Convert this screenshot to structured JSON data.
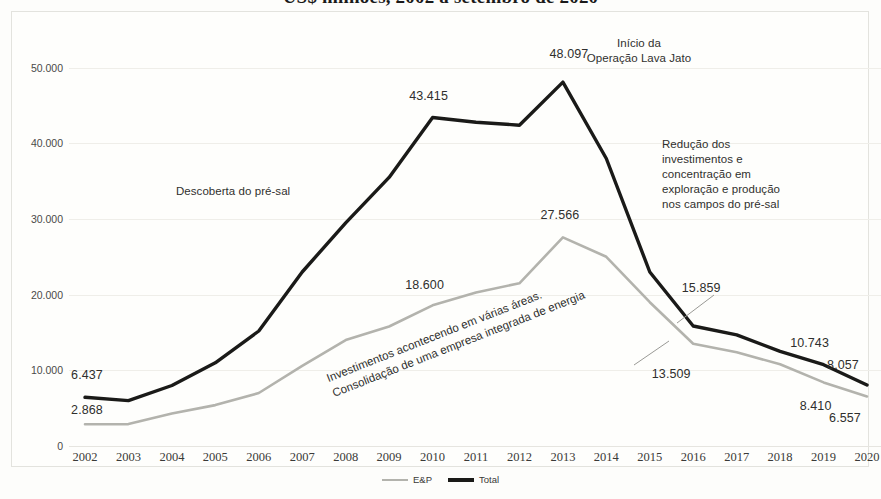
{
  "title": "US$ milhões, 2002 a setembro de 2020",
  "axis": {
    "y_ticks": [
      "50.000",
      "40.000",
      "30.000",
      "20.000",
      "10.000",
      "0"
    ],
    "y_values": [
      50000,
      40000,
      30000,
      20000,
      10000,
      0
    ],
    "x_ticks": [
      "2002",
      "2003",
      "2004",
      "2005",
      "2006",
      "2007",
      "2008",
      "2009",
      "2010",
      "2011",
      "2012",
      "2013",
      "2014",
      "2015",
      "2016",
      "2017",
      "2018",
      "2019",
      "2020"
    ]
  },
  "legend": {
    "items": [
      {
        "label": "E&P",
        "color": "#b3b3ad"
      },
      {
        "label": "Total",
        "color": "#1a1a18"
      }
    ]
  },
  "annotations": [
    {
      "id": "presal",
      "text": "Descoberta do pré-sal"
    },
    {
      "id": "lavajato",
      "text": "Início da\nOperação Lava Jato"
    },
    {
      "id": "reducao",
      "text": "Redução dos\ninvestimentos e\nconcentração em\nexploração e produção\nnos campos do pré-sal"
    },
    {
      "id": "consolidacao",
      "text": "Investimentos acontecendo em várias áreas.\nConsolidação de uma empresa integrada de energia"
    }
  ],
  "point_labels": [
    {
      "id": "total-2002",
      "text": "6.437"
    },
    {
      "id": "ep-2002",
      "text": "2.868"
    },
    {
      "id": "total-2010",
      "text": "43.415"
    },
    {
      "id": "total-2013",
      "text": "48.097"
    },
    {
      "id": "ep-2010",
      "text": "18.600"
    },
    {
      "id": "ep-2013",
      "text": "27.566"
    },
    {
      "id": "total-2016",
      "text": "15.859"
    },
    {
      "id": "ep-2016",
      "text": "13.509"
    },
    {
      "id": "total-2019",
      "text": "10.743"
    },
    {
      "id": "ep-2019",
      "text": "8.410"
    },
    {
      "id": "total-2020",
      "text": "8.057"
    },
    {
      "id": "ep-2020",
      "text": "6.557"
    }
  ],
  "chart_data": {
    "type": "line",
    "title": "US$ milhões, 2002 a setembro de 2020",
    "xlabel": "",
    "ylabel": "",
    "ylim": [
      0,
      53000
    ],
    "grid": true,
    "legend_position": "bottom",
    "categories": [
      "2002",
      "2003",
      "2004",
      "2005",
      "2006",
      "2007",
      "2008",
      "2009",
      "2010",
      "2011",
      "2012",
      "2013",
      "2014",
      "2015",
      "2016",
      "2017",
      "2018",
      "2019",
      "2020"
    ],
    "series": [
      {
        "name": "E&P",
        "color": "#b3b3ad",
        "values": [
          2868,
          2900,
          4300,
          5400,
          7000,
          10600,
          14000,
          15800,
          18600,
          20300,
          21500,
          27566,
          25000,
          19000,
          13509,
          12400,
          10800,
          8410,
          6557
        ]
      },
      {
        "name": "Total",
        "color": "#1a1a18",
        "values": [
          6437,
          6000,
          8000,
          11000,
          15200,
          23000,
          29500,
          35500,
          43415,
          42800,
          42400,
          48097,
          38000,
          23000,
          15859,
          14700,
          12500,
          10743,
          8057
        ]
      }
    ],
    "labeled_points": {
      "E&P": {
        "2002": 2868,
        "2010": 18600,
        "2013": 27566,
        "2016": 13509,
        "2019": 8410,
        "2020": 6557
      },
      "Total": {
        "2002": 6437,
        "2010": 43415,
        "2013": 48097,
        "2016": 15859,
        "2019": 10743,
        "2020": 8057
      }
    }
  }
}
